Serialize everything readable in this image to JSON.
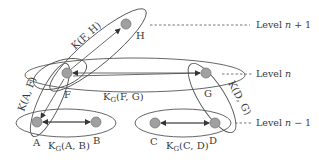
{
  "diagram": {
    "nodes": [
      {
        "id": "H",
        "label": "H"
      },
      {
        "id": "F",
        "label": "F"
      },
      {
        "id": "G",
        "label": "G"
      },
      {
        "id": "A",
        "label": "A"
      },
      {
        "id": "B",
        "label": "B"
      },
      {
        "id": "C",
        "label": "C"
      },
      {
        "id": "D",
        "label": "D"
      }
    ],
    "groups": {
      "fh": {
        "label": "K(F, H)"
      },
      "af": {
        "label": "K(A, F)"
      },
      "dg": {
        "label": "K(D, G)"
      },
      "fg": {
        "label_main": "K",
        "label_sub": "G",
        "label_args": "(F, G)"
      },
      "ab": {
        "label_main": "K",
        "label_sub": "G",
        "label_args": "(A, B)"
      },
      "cd": {
        "label_main": "K",
        "label_sub": "G",
        "label_args": "(C, D)"
      }
    },
    "levels": [
      {
        "prefix": "Level ",
        "var": "n",
        "suffix": " + 1"
      },
      {
        "prefix": "Level ",
        "var": "n",
        "suffix": ""
      },
      {
        "prefix": "Level ",
        "var": "n",
        "suffix": " − 1"
      }
    ]
  }
}
